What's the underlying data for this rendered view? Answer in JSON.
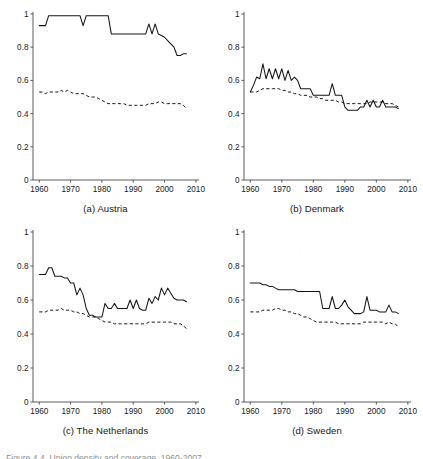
{
  "figure": {
    "caption_cut_off": "Figure 4.4. Union density and coverage, 1960-2007",
    "series_legend": [
      {
        "name": "coverage",
        "style": "solid"
      },
      {
        "name": "density",
        "style": "dashed"
      }
    ]
  },
  "axes": {
    "y_ticks": [
      "0",
      "0.2",
      "0.4",
      "0.6",
      "0.8",
      "1"
    ],
    "y_tick_values": [
      0,
      0.2,
      0.4,
      0.6,
      0.8,
      1
    ],
    "x_ticks": [
      "1960",
      "1970",
      "1980",
      "1990",
      "2000",
      "2010"
    ],
    "x_tick_values": [
      1960,
      1970,
      1980,
      1990,
      2000,
      2010
    ],
    "ylim": [
      0,
      1
    ],
    "xlim": [
      1958,
      2011
    ]
  },
  "chart_data": [
    {
      "type": "line",
      "title": "(a) Austria",
      "xlabel": "",
      "ylabel": "",
      "xlim": [
        1958,
        2011
      ],
      "ylim": [
        0,
        1
      ],
      "grid": false,
      "legend": "none",
      "x": [
        1960,
        1961,
        1962,
        1963,
        1964,
        1965,
        1966,
        1967,
        1968,
        1969,
        1970,
        1971,
        1972,
        1973,
        1974,
        1975,
        1976,
        1977,
        1978,
        1979,
        1980,
        1981,
        1982,
        1983,
        1984,
        1985,
        1986,
        1987,
        1988,
        1989,
        1990,
        1991,
        1992,
        1993,
        1994,
        1995,
        1996,
        1997,
        1998,
        1999,
        2000,
        2001,
        2002,
        2003,
        2004,
        2005,
        2006,
        2007
      ],
      "series": [
        {
          "name": "solid",
          "style": "solid",
          "values": [
            0.93,
            0.93,
            0.93,
            0.99,
            0.99,
            0.99,
            0.99,
            0.99,
            0.99,
            0.99,
            0.99,
            0.99,
            0.99,
            0.99,
            0.93,
            0.99,
            0.99,
            0.99,
            0.99,
            0.99,
            0.99,
            0.99,
            0.99,
            0.88,
            0.88,
            0.88,
            0.88,
            0.88,
            0.88,
            0.88,
            0.88,
            0.88,
            0.88,
            0.88,
            0.88,
            0.94,
            0.88,
            0.94,
            0.88,
            0.87,
            0.86,
            0.84,
            0.82,
            0.8,
            0.75,
            0.75,
            0.76,
            0.76
          ]
        },
        {
          "name": "dashed",
          "style": "dashed",
          "values": [
            0.53,
            0.53,
            0.52,
            0.53,
            0.53,
            0.53,
            0.53,
            0.54,
            0.53,
            0.54,
            0.53,
            0.52,
            0.52,
            0.52,
            0.52,
            0.51,
            0.5,
            0.5,
            0.5,
            0.49,
            0.48,
            0.47,
            0.46,
            0.46,
            0.46,
            0.46,
            0.46,
            0.46,
            0.45,
            0.45,
            0.45,
            0.45,
            0.45,
            0.45,
            0.45,
            0.46,
            0.46,
            0.46,
            0.47,
            0.47,
            0.46,
            0.46,
            0.46,
            0.46,
            0.46,
            0.46,
            0.45,
            0.43
          ]
        }
      ]
    },
    {
      "type": "line",
      "title": "(b) Denmark",
      "xlabel": "",
      "ylabel": "",
      "xlim": [
        1958,
        2011
      ],
      "ylim": [
        0,
        1
      ],
      "grid": false,
      "legend": "none",
      "x": [
        1960,
        1961,
        1962,
        1963,
        1964,
        1965,
        1966,
        1967,
        1968,
        1969,
        1970,
        1971,
        1972,
        1973,
        1974,
        1975,
        1976,
        1977,
        1978,
        1979,
        1980,
        1981,
        1982,
        1983,
        1984,
        1985,
        1986,
        1987,
        1988,
        1989,
        1990,
        1991,
        1992,
        1993,
        1994,
        1995,
        1996,
        1997,
        1998,
        1999,
        2000,
        2001,
        2002,
        2003,
        2004,
        2005,
        2006,
        2007
      ],
      "series": [
        {
          "name": "solid",
          "style": "solid",
          "values": [
            0.53,
            0.57,
            0.62,
            0.61,
            0.7,
            0.61,
            0.67,
            0.61,
            0.67,
            0.61,
            0.67,
            0.6,
            0.66,
            0.6,
            0.62,
            0.6,
            0.55,
            0.55,
            0.55,
            0.55,
            0.51,
            0.51,
            0.51,
            0.51,
            0.51,
            0.51,
            0.58,
            0.51,
            0.51,
            0.51,
            0.44,
            0.42,
            0.42,
            0.42,
            0.42,
            0.44,
            0.44,
            0.48,
            0.44,
            0.48,
            0.44,
            0.44,
            0.48,
            0.44,
            0.44,
            0.44,
            0.44,
            0.43
          ]
        },
        {
          "name": "dashed",
          "style": "dashed",
          "values": [
            0.53,
            0.53,
            0.53,
            0.54,
            0.55,
            0.55,
            0.55,
            0.55,
            0.55,
            0.55,
            0.54,
            0.54,
            0.53,
            0.53,
            0.52,
            0.52,
            0.51,
            0.51,
            0.51,
            0.5,
            0.5,
            0.5,
            0.49,
            0.49,
            0.48,
            0.48,
            0.48,
            0.48,
            0.47,
            0.47,
            0.46,
            0.46,
            0.46,
            0.46,
            0.46,
            0.46,
            0.46,
            0.46,
            0.47,
            0.47,
            0.47,
            0.47,
            0.47,
            0.46,
            0.46,
            0.46,
            0.45,
            0.44
          ]
        }
      ]
    },
    {
      "type": "line",
      "title": "(c) The Netherlands",
      "xlabel": "",
      "ylabel": "",
      "xlim": [
        1958,
        2011
      ],
      "ylim": [
        0,
        1
      ],
      "grid": false,
      "legend": "none",
      "x": [
        1960,
        1961,
        1962,
        1963,
        1964,
        1965,
        1966,
        1967,
        1968,
        1969,
        1970,
        1971,
        1972,
        1973,
        1974,
        1975,
        1976,
        1977,
        1978,
        1979,
        1980,
        1981,
        1982,
        1983,
        1984,
        1985,
        1986,
        1987,
        1988,
        1989,
        1990,
        1991,
        1992,
        1993,
        1994,
        1995,
        1996,
        1997,
        1998,
        1999,
        2000,
        2001,
        2002,
        2003,
        2004,
        2005,
        2006,
        2007
      ],
      "series": [
        {
          "name": "solid",
          "style": "solid",
          "values": [
            0.75,
            0.75,
            0.75,
            0.79,
            0.79,
            0.74,
            0.74,
            0.74,
            0.73,
            0.73,
            0.7,
            0.7,
            0.63,
            0.67,
            0.63,
            0.55,
            0.51,
            0.51,
            0.5,
            0.5,
            0.5,
            0.58,
            0.55,
            0.55,
            0.58,
            0.55,
            0.55,
            0.55,
            0.55,
            0.6,
            0.55,
            0.6,
            0.55,
            0.54,
            0.54,
            0.61,
            0.58,
            0.62,
            0.6,
            0.67,
            0.63,
            0.67,
            0.64,
            0.61,
            0.6,
            0.6,
            0.6,
            0.59
          ]
        },
        {
          "name": "dashed",
          "style": "dashed",
          "values": [
            0.53,
            0.53,
            0.53,
            0.54,
            0.54,
            0.54,
            0.54,
            0.55,
            0.54,
            0.54,
            0.54,
            0.53,
            0.53,
            0.52,
            0.52,
            0.51,
            0.5,
            0.5,
            0.5,
            0.49,
            0.48,
            0.47,
            0.47,
            0.47,
            0.46,
            0.46,
            0.46,
            0.46,
            0.46,
            0.46,
            0.46,
            0.46,
            0.46,
            0.46,
            0.46,
            0.47,
            0.47,
            0.47,
            0.47,
            0.47,
            0.47,
            0.47,
            0.47,
            0.46,
            0.46,
            0.46,
            0.45,
            0.43
          ]
        }
      ]
    },
    {
      "type": "line",
      "title": "(d) Sweden",
      "xlabel": "",
      "ylabel": "",
      "xlim": [
        1958,
        2011
      ],
      "ylim": [
        0,
        1
      ],
      "grid": false,
      "legend": "none",
      "x": [
        1960,
        1961,
        1962,
        1963,
        1964,
        1965,
        1966,
        1967,
        1968,
        1969,
        1970,
        1971,
        1972,
        1973,
        1974,
        1975,
        1976,
        1977,
        1978,
        1979,
        1980,
        1981,
        1982,
        1983,
        1984,
        1985,
        1986,
        1987,
        1988,
        1989,
        1990,
        1991,
        1992,
        1993,
        1994,
        1995,
        1996,
        1997,
        1998,
        1999,
        2000,
        2001,
        2002,
        2003,
        2004,
        2005,
        2006,
        2007
      ],
      "series": [
        {
          "name": "solid",
          "style": "solid",
          "values": [
            0.7,
            0.7,
            0.7,
            0.7,
            0.69,
            0.69,
            0.68,
            0.68,
            0.67,
            0.66,
            0.66,
            0.66,
            0.66,
            0.66,
            0.66,
            0.65,
            0.65,
            0.65,
            0.65,
            0.65,
            0.65,
            0.65,
            0.65,
            0.55,
            0.55,
            0.55,
            0.62,
            0.55,
            0.55,
            0.57,
            0.6,
            0.56,
            0.54,
            0.52,
            0.52,
            0.52,
            0.53,
            0.62,
            0.54,
            0.54,
            0.54,
            0.53,
            0.53,
            0.53,
            0.57,
            0.53,
            0.53,
            0.52
          ]
        },
        {
          "name": "dashed",
          "style": "dashed",
          "values": [
            0.53,
            0.53,
            0.53,
            0.53,
            0.54,
            0.54,
            0.54,
            0.54,
            0.55,
            0.55,
            0.54,
            0.54,
            0.53,
            0.53,
            0.52,
            0.52,
            0.51,
            0.5,
            0.5,
            0.49,
            0.48,
            0.47,
            0.47,
            0.47,
            0.47,
            0.47,
            0.47,
            0.47,
            0.46,
            0.46,
            0.46,
            0.46,
            0.46,
            0.46,
            0.46,
            0.46,
            0.47,
            0.47,
            0.47,
            0.47,
            0.47,
            0.47,
            0.47,
            0.46,
            0.47,
            0.46,
            0.46,
            0.44
          ]
        }
      ]
    }
  ]
}
